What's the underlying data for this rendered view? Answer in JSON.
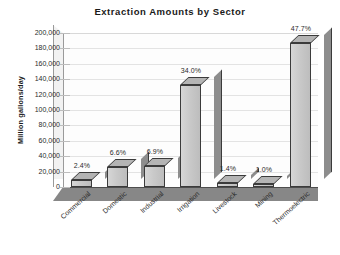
{
  "chart_data": {
    "type": "bar",
    "title": "Extraction Amounts by Sector",
    "xlabel": "",
    "ylabel": "Million gallons/day",
    "ylim": [
      0,
      200000
    ],
    "ytick_step": 20000,
    "grid": true,
    "legend": false,
    "style": "3d-column",
    "categories": [
      "Commercial",
      "Domestic",
      "Industrial",
      "Irrigation",
      "Livestock",
      "Mining",
      "Thermoelectric"
    ],
    "values": [
      9400,
      25800,
      27000,
      133000,
      5500,
      3900,
      186500
    ],
    "data_labels": [
      "2.4%",
      "6.6%",
      "6.9%",
      "34.0%",
      "1.4%",
      "1.0%",
      "47.7%"
    ],
    "percentages": [
      2.4,
      6.6,
      6.9,
      34.0,
      1.4,
      1.0,
      47.7
    ],
    "ytick_labels": [
      "200,000",
      "180,000",
      "160,000",
      "140,000",
      "120,000",
      "100,000",
      "80,000",
      "60,000",
      "40,000",
      "20,000",
      "0"
    ],
    "colors": {
      "bar_face": "#c9c9c9",
      "bar_side": "#8d8d8d",
      "bar_top": "#b4b4b4",
      "bar_outline": "#3b3b3b",
      "floor": "#878787",
      "gridline": "#e3e3e3",
      "plot_background": "#fdfdfd",
      "text": "#2b2b2b",
      "title": "#1a1a1a",
      "page_background": "#ffffff"
    }
  }
}
